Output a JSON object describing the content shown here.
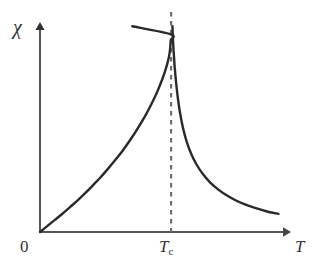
{
  "figure": {
    "width": 318,
    "height": 273,
    "background": "#ffffff"
  },
  "labels": {
    "y_axis": "χ",
    "origin": "0",
    "critical_temperature": "T",
    "critical_temperature_subscript": "c",
    "x_axis": "T"
  },
  "colors": {
    "curve": "#2a2a2a",
    "axis": "#555555",
    "dashed_line": "#6a6a6a",
    "text": "#333333",
    "background": "#ffffff"
  },
  "geometry": {
    "origin_x": 40,
    "origin_y": 232,
    "x_axis_tip_x": 288,
    "y_axis_tip_y": 25,
    "tc_x": 172,
    "dash_top_y": 12,
    "left_curve_top_y": 16,
    "right_curve_top_y": 17,
    "right_curve_end_x": 284,
    "right_curve_end_y": 215
  },
  "chart_data": {
    "type": "line",
    "title": "",
    "xlabel": "T",
    "ylabel": "χ",
    "xlim": [
      0,
      1.3
    ],
    "ylim": [
      0,
      1.05
    ],
    "grid": false,
    "legend": null,
    "annotations": [
      {
        "name": "origin-label",
        "text": "0",
        "x": 0,
        "y": 0
      },
      {
        "name": "critical-temperature-tick",
        "text": "T_c",
        "x": 0.6985,
        "y": 0
      },
      {
        "name": "x-axis-arrow-label",
        "text": "T"
      },
      {
        "name": "y-axis-arrow-label",
        "text": "χ"
      }
    ],
    "vlines": [
      {
        "name": "critical-temperature-line",
        "x": 0.6985,
        "style": "dashed",
        "color": "#6a6a6a"
      }
    ],
    "series": [
      {
        "name": "susceptibility-below-Tc",
        "style": "solid",
        "color": "#2a2a2a",
        "description": "Diverging branch for T < Tc, rising from origin to infinity at Tc",
        "points": [
          [
            0.0,
            0.0
          ],
          [
            0.04,
            0.03
          ],
          [
            0.081,
            0.06
          ],
          [
            0.121,
            0.09
          ],
          [
            0.161,
            0.122
          ],
          [
            0.202,
            0.155
          ],
          [
            0.242,
            0.19
          ],
          [
            0.282,
            0.227
          ],
          [
            0.323,
            0.266
          ],
          [
            0.363,
            0.308
          ],
          [
            0.403,
            0.352
          ],
          [
            0.444,
            0.4
          ],
          [
            0.484,
            0.452
          ],
          [
            0.524,
            0.509
          ],
          [
            0.565,
            0.572
          ],
          [
            0.605,
            0.643
          ],
          [
            0.629,
            0.691
          ],
          [
            0.653,
            0.746
          ],
          [
            0.669,
            0.789
          ],
          [
            0.681,
            0.828
          ],
          [
            0.689,
            0.861
          ],
          [
            0.694,
            0.898
          ],
          [
            0.6965,
            0.932
          ],
          [
            0.6976,
            0.961
          ],
          [
            0.4919,
            1.0
          ]
        ]
      },
      {
        "name": "susceptibility-above-Tc",
        "style": "solid",
        "color": "#2a2a2a",
        "description": "Diverging branch for T > Tc, falling from infinity at Tc toward zero",
        "points": [
          [
            0.7056,
            1.0
          ],
          [
            0.7076,
            0.955
          ],
          [
            0.7097,
            0.911
          ],
          [
            0.7137,
            0.855
          ],
          [
            0.7177,
            0.8
          ],
          [
            0.7258,
            0.72
          ],
          [
            0.7339,
            0.655
          ],
          [
            0.746,
            0.58
          ],
          [
            0.7621,
            0.505
          ],
          [
            0.7823,
            0.437
          ],
          [
            0.8065,
            0.378
          ],
          [
            0.8347,
            0.327
          ],
          [
            0.8669,
            0.283
          ],
          [
            0.9032,
            0.244
          ],
          [
            0.9435,
            0.211
          ],
          [
            0.9879,
            0.182
          ],
          [
            1.0363,
            0.157
          ],
          [
            1.0887,
            0.135
          ],
          [
            1.1452,
            0.117
          ],
          [
            1.2056,
            0.101
          ],
          [
            1.2702,
            0.088
          ]
        ]
      }
    ]
  }
}
